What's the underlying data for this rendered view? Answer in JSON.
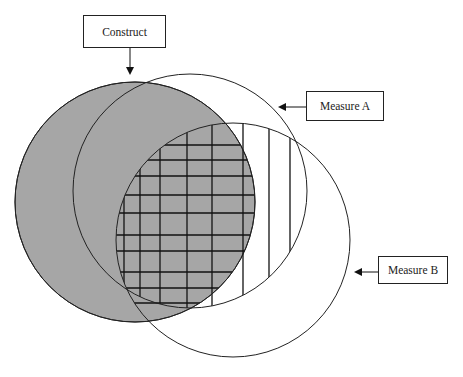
{
  "diagram": {
    "type": "venn",
    "labels": {
      "construct": "Construct",
      "measure_a": "Measure A",
      "measure_b": "Measure B"
    },
    "circles": [
      {
        "id": "construct",
        "cx": 135,
        "cy": 202,
        "r": 120,
        "fill": "#a6a6a6"
      },
      {
        "id": "measure_a",
        "cx": 190,
        "cy": 191,
        "r": 117,
        "fill": "none"
      },
      {
        "id": "measure_b",
        "cx": 233,
        "cy": 240,
        "r": 117,
        "fill": "none"
      }
    ],
    "hatching": {
      "vertical_lines_x": [
        124,
        140,
        160,
        187,
        212,
        243,
        269,
        290
      ],
      "horizontal_lines_y": [
        145,
        160,
        176,
        195,
        213,
        235,
        251,
        272,
        288,
        303
      ],
      "line_color": "#111111"
    },
    "colors": {
      "construct_fill": "#a6a6a6",
      "stroke": "#222222",
      "background": "#ffffff"
    }
  }
}
